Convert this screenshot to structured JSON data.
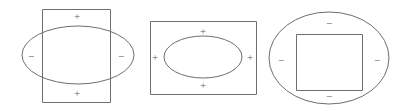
{
  "diagram": {
    "background_color": "#ffffff",
    "stroke_color": "#6e6e6e",
    "label_color": "#5c5c5c",
    "plus_symbol": "+",
    "minus_symbol": "−",
    "figures": [
      {
        "id": "figure-1",
        "description": "Tall rectangle overlapping a wide ellipse",
        "outer_shape": "rectangle",
        "inner_shape": "ellipse",
        "relationship": "overlapping",
        "rectangle": {
          "x": 42,
          "y": 9,
          "width": 68,
          "height": 93
        },
        "ellipse": {
          "cx": 78,
          "cy": 55,
          "rx": 56,
          "ry": 29
        },
        "labels": [
          {
            "name": "top",
            "symbol": "+",
            "x": 77,
            "y": 16
          },
          {
            "name": "left",
            "symbol": "−",
            "x": 31,
            "y": 56
          },
          {
            "name": "right",
            "symbol": "−",
            "x": 121,
            "y": 56
          },
          {
            "name": "bottom",
            "symbol": "+",
            "x": 77,
            "y": 93
          }
        ]
      },
      {
        "id": "figure-2",
        "description": "Rectangle containing an ellipse",
        "outer_shape": "rectangle",
        "inner_shape": "ellipse",
        "relationship": "ellipse-inside-rectangle",
        "rectangle": {
          "x": 150,
          "y": 21,
          "width": 106,
          "height": 73
        },
        "ellipse": {
          "cx": 203,
          "cy": 57,
          "rx": 39,
          "ry": 21
        },
        "labels": [
          {
            "name": "top",
            "symbol": "+",
            "x": 203,
            "y": 31
          },
          {
            "name": "left",
            "symbol": "+",
            "x": 155,
            "y": 57
          },
          {
            "name": "right",
            "symbol": "+",
            "x": 250,
            "y": 57
          },
          {
            "name": "bottom",
            "symbol": "+",
            "x": 203,
            "y": 85
          }
        ]
      },
      {
        "id": "figure-3",
        "description": "Ellipse containing a square",
        "outer_shape": "ellipse",
        "inner_shape": "square",
        "relationship": "square-inside-ellipse",
        "ellipse": {
          "cx": 329,
          "cy": 58,
          "rx": 60,
          "ry": 46
        },
        "square": {
          "x": 296,
          "y": 34,
          "width": 66,
          "height": 56
        },
        "labels": [
          {
            "name": "top",
            "symbol": "−",
            "x": 329,
            "y": 23
          },
          {
            "name": "left",
            "symbol": "−",
            "x": 281,
            "y": 60
          },
          {
            "name": "right",
            "symbol": "−",
            "x": 377,
            "y": 60
          },
          {
            "name": "bottom",
            "symbol": "−",
            "x": 329,
            "y": 96
          }
        ]
      }
    ]
  }
}
